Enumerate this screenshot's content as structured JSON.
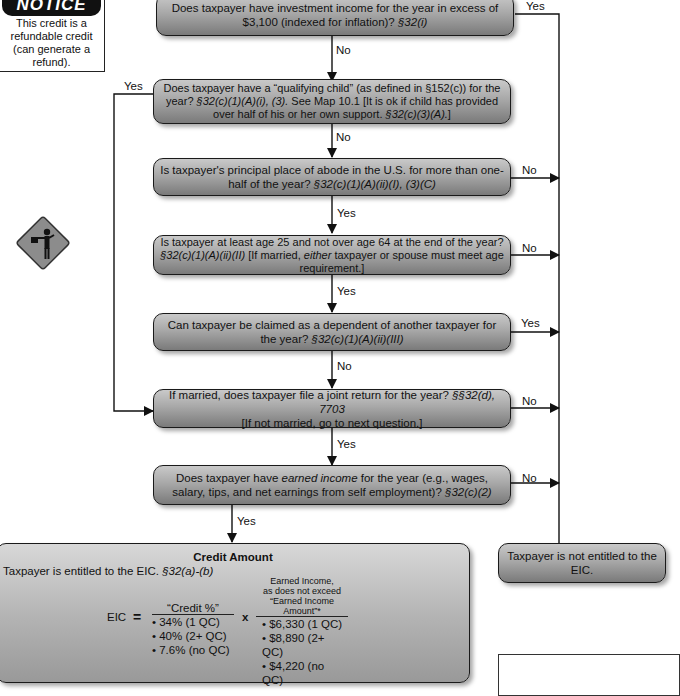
{
  "notice": {
    "heading": "NOTICE",
    "text": "This credit is a refundable credit (can generate a refund)."
  },
  "flagger_sign": {
    "icon": "flagger-warning-sign-icon"
  },
  "questions": [
    {
      "text": "Does taxpayer have investment income for the year in excess of $3,100 (indexed for inflation)?",
      "cite": "§32(i)",
      "down_label": "No",
      "side_label": "Yes"
    },
    {
      "text": "Does taxpayer have a “qualifying child” (as defined in §152(c)) for the year?",
      "cite": "§32(c)(1)(A)(i), (3).",
      "text2": "See Map 10.1 [It is ok if child has provided over half of his or her own support.",
      "cite2": "§32(c)(3)(A).",
      "text3": "]",
      "down_label": "No",
      "side_label": "Yes"
    },
    {
      "text": "Is taxpayer's principal place of abode in the U.S. for more than one-half of the year?",
      "cite": "§32(c)(1)(A)(ii)(I), (3)(C)",
      "down_label": "Yes",
      "side_label": "No"
    },
    {
      "text": "Is taxpayer at least age 25 and not over age 64 at the end of the year?",
      "cite": "§32(c)(1)(A)(ii)(II)",
      "text2": "[If married,",
      "emph": "either",
      "text3": "taxpayer or spouse must meet age requirement.]",
      "down_label": "Yes",
      "side_label": "No"
    },
    {
      "text": "Can taxpayer be claimed as a dependent of another taxpayer for the year?",
      "cite": "§32(c)(1)(A)(ii)(III)",
      "down_label": "No",
      "side_label": "Yes"
    },
    {
      "text": "If married, does taxpayer file a joint return for the year?",
      "cite": "§§32(d), 7703",
      "text2": "[If not married, go to next question.]",
      "down_label": "Yes",
      "side_label": "No"
    },
    {
      "text": "Does taxpayer have",
      "emph": "earned income",
      "text2": "for the year (e.g., wages, salary, tips, and net earnings from self employment)?",
      "cite": "§32(c)(2)",
      "down_label": "Yes",
      "side_label": "No"
    }
  ],
  "not_entitled": {
    "text": "Taxpayer is not entitled to the EIC."
  },
  "credit_amount": {
    "title": "Credit Amount",
    "subtitle": "Taxpayer is entitled to the EIC.",
    "subtitle_cite": "§32(a)-(b)",
    "lhs": "EIC",
    "equals": "=",
    "times": "x",
    "credit_pct_header": "“Credit %”",
    "credit_pct": [
      "• 34% (1 QC)",
      "• 40% (2+ QC)",
      "• 7.6% (no QC)"
    ],
    "earned_header_1": "Earned Income,",
    "earned_header_2": "as does not exceed",
    "earned_header_3": "“Earned Income Amount”*",
    "earned_amounts": [
      "• $6,330 (1 QC)",
      "• $8,890 (2+ QC)",
      "• $4,220 (no QC)"
    ]
  }
}
